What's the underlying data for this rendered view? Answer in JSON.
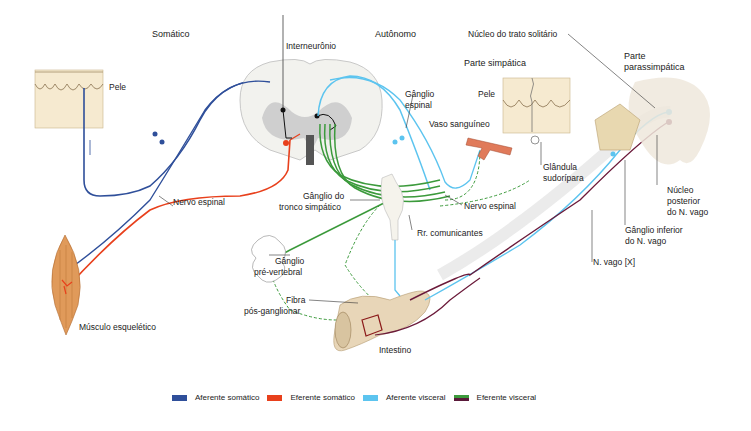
{
  "headers": {
    "somatic": "Somático",
    "autonomic": "Autônomo",
    "sympathetic": "Parte simpática",
    "parasympathetic_1": "Parte",
    "parasympathetic_2": "parassimpática"
  },
  "labels": {
    "skin_left": "Pele",
    "skin_right": "Pele",
    "interneuron": "Interneurônio",
    "spinal_ganglion_1": "Gânglio",
    "spinal_ganglion_2": "espinal",
    "blood_vessel": "Vaso sanguíneo",
    "sweat_gland_1": "Glândula",
    "sweat_gland_2": "sudorípara",
    "spinal_nerve_left": "Nervo espinal",
    "spinal_nerve_right": "Nervo espinal",
    "sympathetic_trunk_ganglion_1": "Gânglio do",
    "sympathetic_trunk_ganglion_2": "tronco simpático",
    "rami_communicantes": "Rr. comunicantes",
    "prevertebral_ganglion_1": "Gânglio",
    "prevertebral_ganglion_2": "pré-vertebral",
    "postganglionic_fiber_1": "Fibra",
    "postganglionic_fiber_2": "pós-ganglionar",
    "skeletal_muscle": "Músculo esquelético",
    "intestine": "Intestino",
    "solitary_tract_nucleus": "Núcleo do trato solitário",
    "vagus_posterior_nucleus_1": "Núcleo",
    "vagus_posterior_nucleus_2": "posterior",
    "vagus_posterior_nucleus_3": "do N. vago",
    "vagus_inferior_ganglion_1": "Gânglio inferior",
    "vagus_inferior_ganglion_2": "do N. vago",
    "vagus_nerve": "N. vago [X]"
  },
  "legend": [
    {
      "label": "Aferente somático",
      "color": "#2f4f9a"
    },
    {
      "label": "Eferente somático",
      "color": "#e8401c"
    },
    {
      "label": "Aferente visceral",
      "color": "#5cc4ef"
    },
    {
      "label": "Eferente visceral",
      "color": "#5a1a3a",
      "color2": "#3c9a3c"
    }
  ],
  "colors": {
    "somatic_afferent": "#2f4f9a",
    "somatic_efferent": "#e8401c",
    "visceral_afferent": "#5cc4ef",
    "visceral_efferent_symp": "#3c9a3c",
    "visceral_efferent_para": "#6b1a3a",
    "skin": "#f4e6c8",
    "muscle": "#e09a5a",
    "intestine": "#e8d6b8",
    "vessel": "#e07a5a"
  }
}
